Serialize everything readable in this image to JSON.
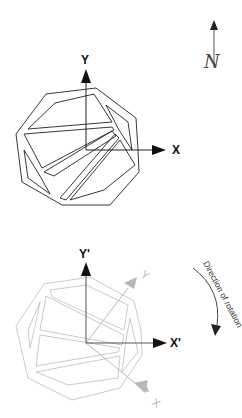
{
  "figure": {
    "top_panel": {
      "axis_x_label": "X",
      "axis_y_label": "Y",
      "north_label": "N",
      "stroke_color": "#222222"
    },
    "bottom_panel": {
      "axis_x_label": "X'",
      "axis_y_label": "Y'",
      "ghost_x_label": "X",
      "ghost_y_label": "Y",
      "rotation_label": "Direction of rotation",
      "stroke_color": "#bbbbbb",
      "ghost_axis_color": "#b0b0b0"
    }
  }
}
